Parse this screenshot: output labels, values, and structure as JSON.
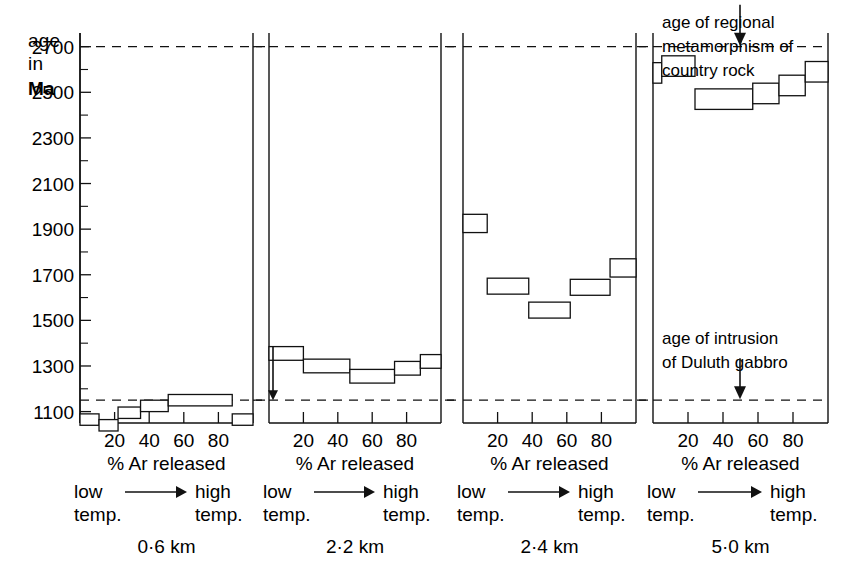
{
  "figure": {
    "domain": "chart",
    "y_axis_title_lines": [
      "age",
      "in",
      "Ma"
    ],
    "x_axis_caption": "%  Ar released",
    "temp_low_label": "low",
    "temp_low_label2": "temp.",
    "temp_high_label": "high",
    "temp_high_label2": "temp.",
    "arrow_icon": "right-arrow-icon",
    "annotations": [
      {
        "id": "regional-metamorphism",
        "lines": [
          "age of regional",
          "metamorphism of",
          "country rock"
        ],
        "points_to_value": 2700,
        "arrow_icon": "down-arrow-icon"
      },
      {
        "id": "duluth-gabbro",
        "lines": [
          "age of intrusion",
          "of Duluth gabbro"
        ],
        "points_to_value": 1150,
        "arrow_icon": "down-arrow-icon"
      }
    ]
  },
  "chart_data": {
    "type": "bar",
    "title": "",
    "subtitle": "",
    "xlabel": "%  Ar released",
    "ylabel": "age in Ma",
    "ylim": [
      1050,
      2760
    ],
    "xlim": [
      0,
      100
    ],
    "grid": false,
    "legend": "none",
    "y_ticks_major": [
      1100,
      1300,
      1500,
      1700,
      1900,
      2100,
      2300,
      2500,
      2700
    ],
    "y_ticks_minor": [
      1200,
      1400,
      1600,
      1800,
      2000,
      2200,
      2400,
      2600
    ],
    "y_tick_labels": [
      "1100",
      "1300",
      "1500",
      "1700",
      "1900",
      "2100",
      "2300",
      "2500",
      "2700"
    ],
    "x_ticks": [
      20,
      40,
      60,
      80
    ],
    "x_tick_labels": [
      "20",
      "40",
      "60",
      "80"
    ],
    "reference_lines": [
      {
        "label": "age of regional metamorphism of country rock",
        "value": 2700,
        "style": "dashed"
      },
      {
        "label": "age of intrusion of Duluth gabbro",
        "value": 1150,
        "style": "dashed"
      }
    ],
    "panels": [
      {
        "name": "0.6 km",
        "label": "0·6 km",
        "leading_arrow": false,
        "steps": [
          {
            "x0": 0,
            "x1": 11,
            "age": 1065,
            "error": 25
          },
          {
            "x0": 11,
            "x1": 22,
            "age": 1040,
            "error": 25
          },
          {
            "x0": 22,
            "x1": 35,
            "age": 1095,
            "error": 25
          },
          {
            "x0": 35,
            "x1": 51,
            "age": 1125,
            "error": 25
          },
          {
            "x0": 51,
            "x1": 88,
            "age": 1150,
            "error": 25
          },
          {
            "x0": 88,
            "x1": 100,
            "age": 1065,
            "error": 25
          }
        ]
      },
      {
        "name": "2.2 km",
        "label": "2·2 km",
        "leading_arrow": true,
        "steps": [
          {
            "x0": 0,
            "x1": 20,
            "age": 1355,
            "error": 30
          },
          {
            "x0": 20,
            "x1": 47,
            "age": 1300,
            "error": 30
          },
          {
            "x0": 47,
            "x1": 73,
            "age": 1255,
            "error": 30
          },
          {
            "x0": 73,
            "x1": 88,
            "age": 1290,
            "error": 30
          },
          {
            "x0": 88,
            "x1": 100,
            "age": 1320,
            "error": 30
          }
        ]
      },
      {
        "name": "2.4 km",
        "label": "2·4 km",
        "leading_arrow": false,
        "steps": [
          {
            "x0": 0,
            "x1": 14,
            "age": 1925,
            "error": 40
          },
          {
            "x0": 14,
            "x1": 38,
            "age": 1650,
            "error": 35
          },
          {
            "x0": 38,
            "x1": 62,
            "age": 1545,
            "error": 35
          },
          {
            "x0": 62,
            "x1": 85,
            "age": 1645,
            "error": 35
          },
          {
            "x0": 85,
            "x1": 100,
            "age": 1730,
            "error": 40
          }
        ]
      },
      {
        "name": "5.0 km",
        "label": "5·0 km",
        "leading_arrow": false,
        "steps": [
          {
            "x0": 0,
            "x1": 5,
            "age": 2585,
            "error": 45
          },
          {
            "x0": 5,
            "x1": 24,
            "age": 2615,
            "error": 45
          },
          {
            "x0": 24,
            "x1": 57,
            "age": 2470,
            "error": 45
          },
          {
            "x0": 57,
            "x1": 72,
            "age": 2495,
            "error": 45
          },
          {
            "x0": 72,
            "x1": 87,
            "age": 2530,
            "error": 45
          },
          {
            "x0": 87,
            "x1": 100,
            "age": 2590,
            "error": 45
          }
        ]
      }
    ]
  }
}
